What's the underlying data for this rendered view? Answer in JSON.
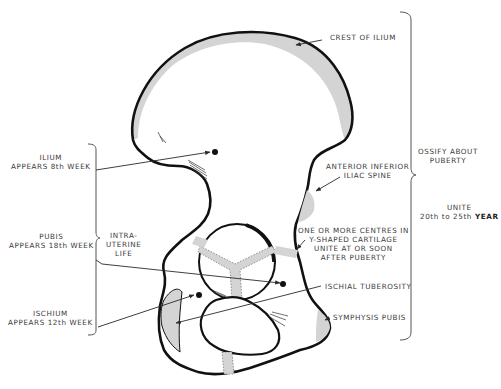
{
  "diagram": {
    "type": "anatomical-diagram",
    "colors": {
      "outline": "#111111",
      "cartilage_fill": "#d4d4d4",
      "text": "#3a3a3a",
      "leader_line": "#2a2a2a"
    },
    "labels": {
      "crest_of_ilium": "CREST OF ILIUM",
      "anterior_inferior_iliac_spine": {
        "line1": "ANTERIOR INFERIOR",
        "line2": "ILIAC SPINE"
      },
      "y_shaped_cartilage": {
        "line1": "ONE OR MORE CENTRES IN",
        "line2": "Y-SHAPED CARTILAGE",
        "line3": "UNITE AT OR SOON",
        "line4": "AFTER PUBERTY"
      },
      "ischial_tuberosity": "ISCHIAL TUBEROSITY",
      "symphysis_pubis": "SYMPHYSIS PUBIS",
      "ilium": {
        "line1": "ILIUM",
        "line2": "APPEARS 8th WEEK"
      },
      "pubis": {
        "line1": "PUBIS",
        "line2": "APPEARS 18th WEEK"
      },
      "ischium": {
        "line1": "ISCHIUM",
        "line2": "APPEARS 12th WEEK"
      },
      "intra_uterine_life": {
        "line1": "INTRA-",
        "line2": "UTERINE",
        "line3": "LIFE"
      },
      "ossify_about_puberty": {
        "line1": "OSSIFY ABOUT",
        "line2": "PUBERTY"
      },
      "unite": {
        "line1": "UNITE",
        "line2_prefix": "20th to 25th",
        "line2_strong": "YEAR"
      }
    }
  }
}
